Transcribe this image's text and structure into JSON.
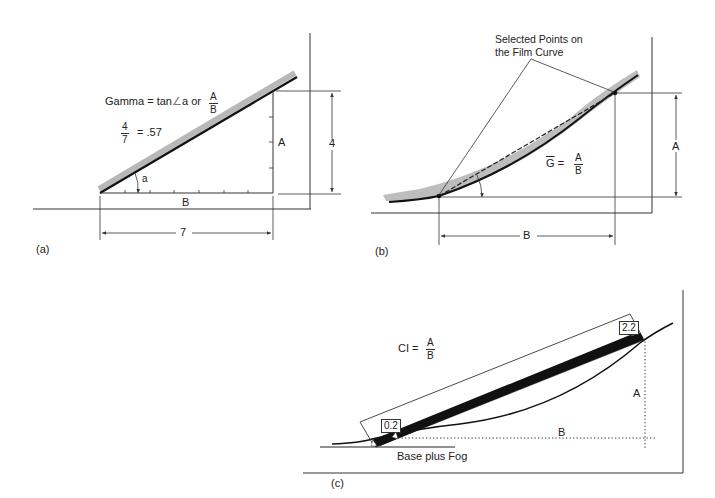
{
  "panels": {
    "a": {
      "label": "(a)",
      "formula": {
        "prefix": "Gamma",
        "equals": "=",
        "middle": "tan",
        "angle_symbol": "∠",
        "angle_var": "a",
        "or": "or",
        "num": "A",
        "den": "B"
      },
      "example": {
        "num": "4",
        "den": "7",
        "equals": "=",
        "result": ".57"
      },
      "angle_label": "a",
      "side_a": "A",
      "side_b": "B",
      "dim_vertical": "4",
      "dim_horizontal": "7"
    },
    "b": {
      "label": "(b)",
      "callout": {
        "line1": "Selected Points on",
        "line2": "the Film Curve"
      },
      "formula": {
        "lhs": "G",
        "equals": "=",
        "num": "A",
        "den": "B"
      },
      "dim_vertical": "A",
      "dim_horizontal": "B"
    },
    "c": {
      "label": "(c)",
      "formula": {
        "lhs": "CI",
        "equals": "=",
        "num": "A",
        "den": "B"
      },
      "low_density": "0.2",
      "high_density": "2.2",
      "base_label": "Base plus Fog",
      "dim_vertical": "A",
      "dim_horizontal": "B"
    }
  },
  "colors": {
    "line": "#1a1a1a",
    "thin_line": "#444444",
    "curve_band": "#b8b8b8",
    "background": "#ffffff"
  }
}
